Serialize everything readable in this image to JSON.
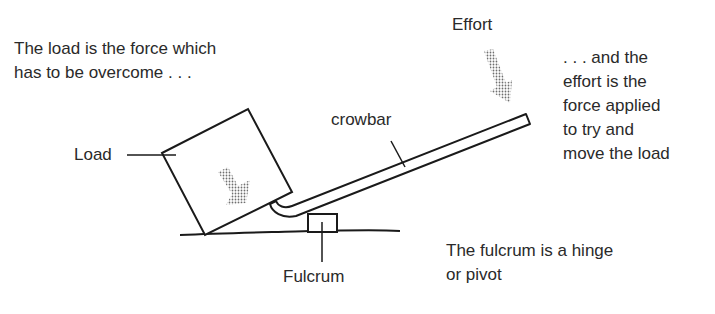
{
  "labels": {
    "load_description_line1": "The load is the force which",
    "load_description_line2": "has to be overcome . . .",
    "effort_title": "Effort",
    "effort_description_line1": ". . . and the",
    "effort_description_line2": "effort is the",
    "effort_description_line3": "force applied",
    "effort_description_line4": "to try and",
    "effort_description_line5": "move the load",
    "crowbar": "crowbar",
    "load": "Load",
    "fulcrum": "Fulcrum",
    "fulcrum_description_line1": "The fulcrum is a hinge",
    "fulcrum_description_line2": "or pivot"
  },
  "colors": {
    "ink": "#1a1a1a",
    "arrow_stipple": "#8a8a8a",
    "background": "#ffffff"
  }
}
